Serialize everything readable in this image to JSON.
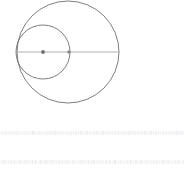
{
  "figure": {
    "background_color": "#ffffff",
    "width": 184,
    "height": 173
  },
  "chart_data": {
    "type": "scatter",
    "xlabel": "",
    "ylabel": "",
    "xlim": [
      0,
      184
    ],
    "ylim": [
      0,
      173
    ],
    "grid": false,
    "legend": "none",
    "shapes": [
      {
        "name": "large-circle",
        "kind": "circle",
        "cx": 68,
        "cy": 52,
        "r": 51,
        "stroke": "#6e6e78",
        "stroke_width": 0.9,
        "fill": "none"
      },
      {
        "name": "small-circle",
        "kind": "circle",
        "cx": 43,
        "cy": 52,
        "r": 27,
        "stroke": "#6e6e78",
        "stroke_width": 0.9,
        "fill": "none"
      },
      {
        "name": "diameter-line",
        "kind": "line",
        "x1": 17,
        "y1": 52,
        "x2": 119,
        "y2": 52,
        "stroke": "#b0b0b6",
        "stroke_width": 1.1
      }
    ],
    "points": [
      {
        "name": "small-circle-center-point",
        "x": 43,
        "y": 52,
        "r": 1.9,
        "color": "#6e6e78"
      },
      {
        "name": "tangent-intersection-point",
        "x": 69,
        "y": 52,
        "r": 1.7,
        "color": "#8a8a92"
      }
    ],
    "annotations": []
  },
  "colors": {
    "circle_stroke": "#6e6e78",
    "line_stroke": "#b0b0b6",
    "point_fill": "#6e6e78",
    "microtext": "#c9c9cf",
    "faint_mark": "#f2f2f5",
    "background": "#ffffff"
  },
  "microtext": {
    "upper_line": "·|·|·||·|·||·|·|||·|·|·||·||·|·||||·|·||·|·|·||·||·|·|||·|·||·|·|·||·||·|·||·|·|||·|·||·|·|·||·||·|·|||·|·||·|·|·||·||·|·||·|·|||·|·||·|·|·||·||·|·|||·|·||·|·|·||·||·|·||·|·|||·|·||·|·|·||·||·|·|||·|·||·|·|·||·||·|·||",
    "lower_line": "·|·||·|·|·||·||·|·|||·|·||·|·|·||·||·|·||·|·|||·|·||·|·|·||·||·|·|||·|·||·|·|·||·||·|·||·|·|||·|·||·|·|·||·||·|·|||·|·||·|·|·||·||·|·||·|·|||·|·||·|·|·||·||·|·|||·|·||·|·|·||·||·|·||·|·|||·|·||·|·|·||·||·|·|||·|·||",
    "faint_marks": "· · ·"
  }
}
